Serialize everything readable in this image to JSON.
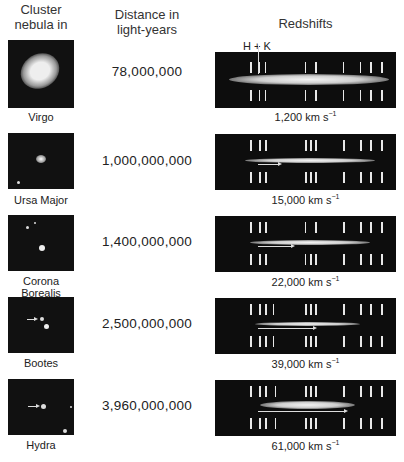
{
  "headers": {
    "nebula": [
      "Cluster",
      "nebula in"
    ],
    "distance": [
      "Distance in",
      "light-years"
    ],
    "redshifts": "Redshifts"
  },
  "hk_label": "H + K",
  "rows": [
    {
      "name": [
        "Virgo"
      ],
      "distance": "78,000,000",
      "velocity": "1,200 km s",
      "velocity_unit_exp": "−1",
      "shift_px": 0
    },
    {
      "name": [
        "Ursa Major"
      ],
      "distance": "1,000,000,000",
      "velocity": "15,000 km s",
      "velocity_unit_exp": "−1",
      "shift_px": 22
    },
    {
      "name": [
        "Corona",
        "Borealis"
      ],
      "distance": "1,400,000,000",
      "velocity": "22,000 km s",
      "velocity_unit_exp": "−1",
      "shift_px": 35
    },
    {
      "name": [
        "Bootes"
      ],
      "distance": "2,500,000,000",
      "velocity": "39,000 km s",
      "velocity_unit_exp": "−1",
      "shift_px": 57
    },
    {
      "name": [
        "Hydra"
      ],
      "distance": "3,960,000,000",
      "velocity": "61,000 km s",
      "velocity_unit_exp": "−1",
      "shift_px": 88
    }
  ]
}
